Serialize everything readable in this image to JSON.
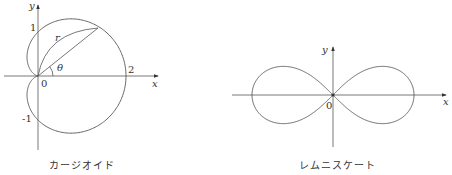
{
  "figures": [
    {
      "name": "cardioid",
      "caption": "カージオイド",
      "equation_form": "r = 1 + cos θ",
      "axis_labels": {
        "x": "x",
        "y": "y"
      },
      "tick_labels": {
        "origin": "0",
        "y_pos": "1",
        "y_neg": "-1",
        "x_pos": "2"
      },
      "annotations": {
        "radius": "r",
        "angle": "θ"
      }
    },
    {
      "name": "lemniscate",
      "caption": "レムニスケート",
      "axis_labels": {
        "x": "x",
        "y": "y"
      },
      "tick_labels": {
        "origin": "0"
      }
    }
  ],
  "colors": {
    "stroke": "#555555",
    "text": "#333333"
  }
}
